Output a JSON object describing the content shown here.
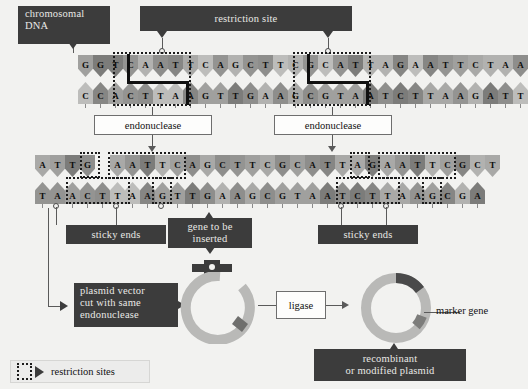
{
  "diagram": {
    "background_color": "#f2f2f0",
    "dark_box_color": "#3c3c3c",
    "dark_box_text_color": "#e9e9e6"
  },
  "labels": {
    "chromosomal_dna": "chromosomal\nDNA",
    "chromosomal_dna_line1": "chromosomal",
    "chromosomal_dna_line2": "DNA",
    "restriction_site": "restriction site",
    "endonuclease_left": "endonuclease",
    "endonuclease_right": "endonuclease",
    "sticky_ends_left": "sticky ends",
    "sticky_ends_right": "sticky ends",
    "gene_to_be_inserted_line1": "gene to be",
    "gene_to_be_inserted_line2": "inserted",
    "plasmid_vector_line1": "plasmid vector",
    "plasmid_vector_line2": "cut with same",
    "plasmid_vector_line3": "endonuclease",
    "ligase": "ligase",
    "marker_gene": "marker gene",
    "recombinant_line1": "recombinant",
    "recombinant_line2": "or modified plasmid",
    "legend_restriction_sites": "restriction sites"
  },
  "dna": {
    "uncut": {
      "top": [
        "G",
        "G",
        "T",
        "C",
        "A",
        "A",
        "T",
        "T",
        "C",
        "A",
        "G",
        "C",
        "T",
        "T",
        "C",
        "G",
        "C",
        "A",
        "T",
        "T",
        "A",
        "G",
        "A",
        "A",
        "T",
        "T",
        "C",
        "T",
        "A",
        "A"
      ],
      "bottom": [
        "C",
        "C",
        "A",
        "C",
        "T",
        "T",
        "A",
        "A",
        "G",
        "T",
        "T",
        "G",
        "A",
        "A",
        "G",
        "C",
        "G",
        "T",
        "A",
        "A",
        "T",
        "C",
        "T",
        "T",
        "A",
        "A",
        "G",
        "A",
        "T",
        "T"
      ]
    },
    "cut_fragment_1": {
      "top": [
        "A",
        "T",
        "T",
        "G"
      ],
      "bottom": [
        "T",
        "A",
        "A",
        "C",
        "T",
        "T",
        "A",
        "A"
      ]
    },
    "cut_fragment_2": {
      "top": [
        "A",
        "A",
        "T",
        "T",
        "C",
        "A",
        "G",
        "C",
        "T",
        "T",
        "C",
        "G",
        "C",
        "A",
        "T",
        "T",
        "A",
        "G"
      ],
      "bottom": [
        "G",
        "T",
        "T",
        "G",
        "A",
        "A",
        "G",
        "C",
        "G",
        "T",
        "A",
        "A",
        "T",
        "C",
        "T",
        "T",
        "A",
        "A"
      ]
    },
    "cut_fragment_3": {
      "top": [
        "A",
        "A",
        "T",
        "T",
        "C",
        "G",
        "C",
        "T"
      ],
      "bottom": [
        "G",
        "C",
        "G",
        "A"
      ]
    }
  },
  "plasmids": {
    "cut_plasmid_label": "plasmid vector cut with same endonuclease",
    "recombinant_label": "recombinant or modified plasmid",
    "ring_color": "#b9b9b7",
    "insert_color": "#4a4a4a",
    "marker_color": "#7d7d7b"
  },
  "icons": {
    "legend_box": "dotted-box-icon",
    "legend_arrow": "triangle-right-icon"
  }
}
